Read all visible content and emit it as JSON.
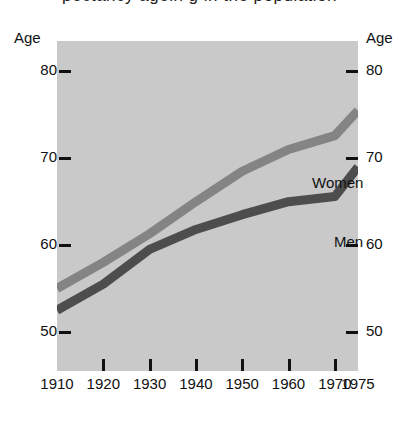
{
  "title_remnant": "pectancy agein g in the population",
  "axis": {
    "y_title_left": "Age",
    "y_title_right": "Age",
    "y_ticks": [
      "80",
      "70",
      "60",
      "50"
    ],
    "x_ticks": [
      "1910",
      "1920",
      "1930",
      "1940",
      "1950",
      "1960",
      "1970",
      "1975"
    ]
  },
  "series_labels": {
    "women": "Women",
    "men": "Men"
  },
  "colors": {
    "background": "#ffffff",
    "plot_background": "#c9c9c9",
    "women_line": "#848484",
    "men_line": "#4d4d4d",
    "text": "#111111",
    "tick": "#111111"
  },
  "chart_data": {
    "type": "line",
    "title": "",
    "xlabel": "",
    "ylabel": "Age",
    "xlim": [
      1910,
      1975
    ],
    "ylim": [
      45.5,
      83.5
    ],
    "grid": false,
    "legend": "inline-labels",
    "y_ticks": [
      50,
      60,
      70,
      80
    ],
    "x_ticks": [
      1910,
      1920,
      1930,
      1940,
      1950,
      1960,
      1970,
      1975
    ],
    "x": [
      1910,
      1920,
      1930,
      1940,
      1950,
      1960,
      1970,
      1975
    ],
    "series": [
      {
        "name": "Women",
        "color": "#848484",
        "values": [
          55.0,
          58.0,
          61.3,
          65.0,
          68.5,
          71.0,
          72.6,
          75.5
        ]
      },
      {
        "name": "Men",
        "color": "#4d4d4d",
        "values": [
          52.5,
          55.5,
          59.5,
          61.8,
          63.5,
          65.0,
          65.6,
          69.0
        ]
      }
    ]
  }
}
